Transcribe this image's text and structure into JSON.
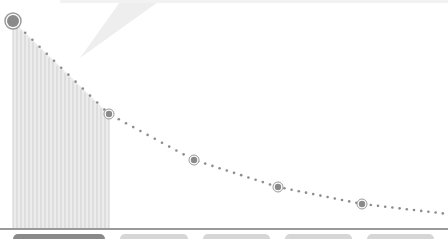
{
  "chart_data": {
    "type": "line",
    "title": "",
    "xlabel": "",
    "ylabel": "",
    "grid": false,
    "legend": null,
    "points_px": [
      {
        "x": 13,
        "y": 21,
        "marker": "large"
      },
      {
        "x": 109,
        "y": 114,
        "marker": "small"
      },
      {
        "x": 194,
        "y": 160,
        "marker": "small"
      },
      {
        "x": 278,
        "y": 187,
        "marker": "small"
      },
      {
        "x": 362,
        "y": 204,
        "marker": "small"
      }
    ],
    "x": [
      0,
      1,
      2,
      3,
      4,
      5
    ],
    "values": [
      100,
      45.6,
      32.4,
      19.4,
      11.1,
      7.5
    ],
    "shaded_region": {
      "x_start": 0,
      "x_end": 1,
      "style": "vertical-stripes"
    },
    "colors": {
      "line_dots": "#8c8c8c",
      "marker_fill": "#8a8a8a",
      "marker_ring": "#9a9a9a",
      "stripes": "#d0d0d0",
      "shade": "#ececec",
      "baseline": "#9a9a9a"
    }
  },
  "tabs": [
    {
      "state": "active",
      "x": 13,
      "w": 92
    },
    {
      "state": "inactive",
      "x": 120,
      "w": 68
    },
    {
      "state": "inactive",
      "x": 203,
      "w": 67
    },
    {
      "state": "inactive",
      "x": 285,
      "w": 67
    },
    {
      "state": "inactive",
      "x": 367,
      "w": 67
    }
  ],
  "callout": {
    "color": "#efefef"
  }
}
